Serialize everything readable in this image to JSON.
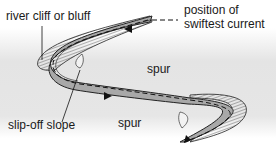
{
  "diagram": {
    "labels": {
      "river_cliff": "river cliff or bluff",
      "legend_line1": "position of",
      "legend_line2": "swiftest current",
      "spur_upper": "spur",
      "spur_lower": "spur",
      "slip_off": "slip-off slope"
    },
    "legend": {
      "symbol": "dashed-line",
      "meaning": "position of swiftest current"
    },
    "colors": {
      "land": "#e6e6e6",
      "river": "#a8a8a8",
      "bank_outline": "#222222",
      "text": "#1a1a1a"
    }
  }
}
